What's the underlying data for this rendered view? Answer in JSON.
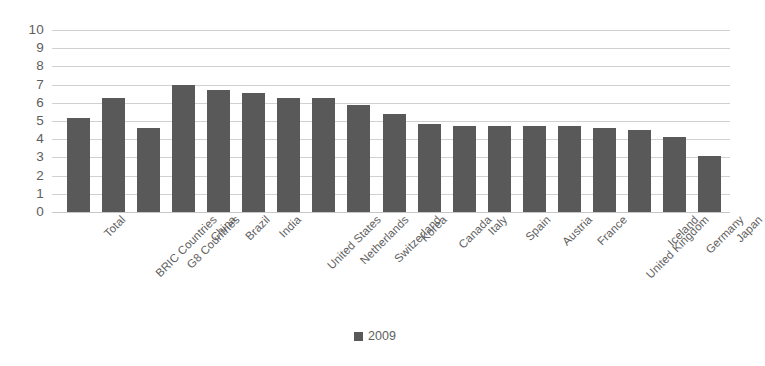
{
  "chart_data": {
    "type": "bar",
    "title": "",
    "subtitle": "",
    "xlabel": "",
    "ylabel": "",
    "ylim": [
      0,
      10
    ],
    "ytick_step": 1,
    "grid": true,
    "legend_position": "bottom",
    "categories": [
      "Total",
      "BRIC Countries",
      "G8 Countries",
      "China",
      "Brazil",
      "India",
      "United States",
      "Netherlands",
      "Switzerland",
      "Korea",
      "Canada",
      "Italy",
      "Spain",
      "Austria",
      "France",
      "United Kingdom",
      "Iceland",
      "Germany",
      "Japan"
    ],
    "yticks": [
      "10",
      "9",
      "8",
      "7",
      "6",
      "5",
      "4",
      "3",
      "2",
      "1",
      "0"
    ],
    "series": [
      {
        "name": "2009",
        "color": "#595959",
        "values": [
          5.15,
          6.25,
          4.6,
          7.0,
          6.7,
          6.55,
          6.25,
          6.25,
          5.9,
          5.4,
          4.85,
          4.75,
          4.75,
          4.7,
          4.7,
          4.6,
          4.5,
          4.1,
          3.1
        ]
      }
    ],
    "legend": [
      {
        "label": "2009",
        "color": "#595959",
        "marker": "square-marker"
      }
    ]
  },
  "colors": {
    "bar": "#595959",
    "gridline": "#c9c9c9",
    "text": "#5e5e5e",
    "background": "#ffffff"
  }
}
